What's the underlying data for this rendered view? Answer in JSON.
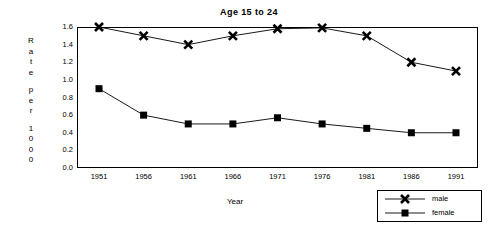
{
  "chart_data": {
    "type": "line",
    "title": "Age 15 to 24",
    "xlabel": "Year",
    "ylabel": "Rate per 1000",
    "ylabel_chars": [
      "R",
      "a",
      "t",
      "e",
      "",
      "p",
      "e",
      "r",
      "",
      "1",
      "0",
      "0",
      "0"
    ],
    "categories": [
      1951,
      1956,
      1961,
      1966,
      1971,
      1976,
      1981,
      1986,
      1991
    ],
    "xtick_labels": [
      "1951",
      "1956",
      "1961",
      "1966",
      "1971",
      "1976",
      "1981",
      "1986",
      "1991"
    ],
    "ytick_labels": [
      "1.6",
      "1.4",
      "1.2",
      "1.0",
      "0.8",
      "0.6",
      "0.4",
      "0.2",
      "0.0"
    ],
    "ytick_values": [
      1.6,
      1.4,
      1.2,
      1.0,
      0.8,
      0.6,
      0.4,
      0.2,
      0.0
    ],
    "ylim": [
      0.0,
      1.6
    ],
    "xlim": [
      1951,
      1991
    ],
    "grid": false,
    "legend_position": "bottom-right",
    "series": [
      {
        "name": "male",
        "marker": "x",
        "color": "#000000",
        "values": [
          1.6,
          1.5,
          1.4,
          1.5,
          1.58,
          1.59,
          1.5,
          1.2,
          1.1
        ]
      },
      {
        "name": "female",
        "marker": "square",
        "color": "#000000",
        "values": [
          0.9,
          0.6,
          0.5,
          0.5,
          0.57,
          0.5,
          0.45,
          0.4,
          0.4
        ]
      }
    ]
  },
  "legend": {
    "entries": [
      {
        "label": "male"
      },
      {
        "label": "female"
      }
    ]
  }
}
